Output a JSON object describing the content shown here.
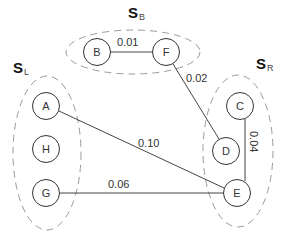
{
  "diagram": {
    "type": "graph",
    "colors": {
      "node_stroke": "#333333",
      "edge_stroke": "#444444",
      "group_stroke": "#9a9a9a",
      "text": "#333333"
    },
    "groups": [
      {
        "id": "SB",
        "letter": "S",
        "subscript": "B",
        "members": [
          "B",
          "F"
        ]
      },
      {
        "id": "SL",
        "letter": "S",
        "subscript": "L",
        "members": [
          "A",
          "H",
          "G"
        ]
      },
      {
        "id": "SR",
        "letter": "S",
        "subscript": "R",
        "members": [
          "C",
          "D",
          "E"
        ]
      }
    ],
    "nodes": [
      {
        "id": "A",
        "label": "A"
      },
      {
        "id": "B",
        "label": "B"
      },
      {
        "id": "C",
        "label": "C"
      },
      {
        "id": "D",
        "label": "D"
      },
      {
        "id": "E",
        "label": "E"
      },
      {
        "id": "F",
        "label": "F"
      },
      {
        "id": "G",
        "label": "G"
      },
      {
        "id": "H",
        "label": "H"
      }
    ],
    "edges": [
      {
        "from": "B",
        "to": "F",
        "weight": "0.01"
      },
      {
        "from": "F",
        "to": "D",
        "weight": "0.02"
      },
      {
        "from": "C",
        "to": "E",
        "weight": "0.04"
      },
      {
        "from": "A",
        "to": "E",
        "weight": "0.10"
      },
      {
        "from": "G",
        "to": "E",
        "weight": "0.06"
      }
    ]
  }
}
